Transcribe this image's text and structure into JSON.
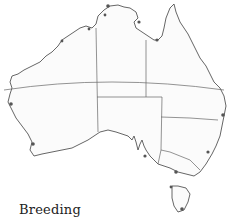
{
  "map": {
    "subject": "Australia",
    "features": [
      "coastline",
      "state-borders",
      "tropic-of-capricorn",
      "breeding-sites"
    ],
    "colors": {
      "outline": "#555555",
      "land": "#fbfbfb",
      "site": "#555555"
    },
    "breeding_site_count": 14
  },
  "legend": {
    "label": "Breeding"
  }
}
